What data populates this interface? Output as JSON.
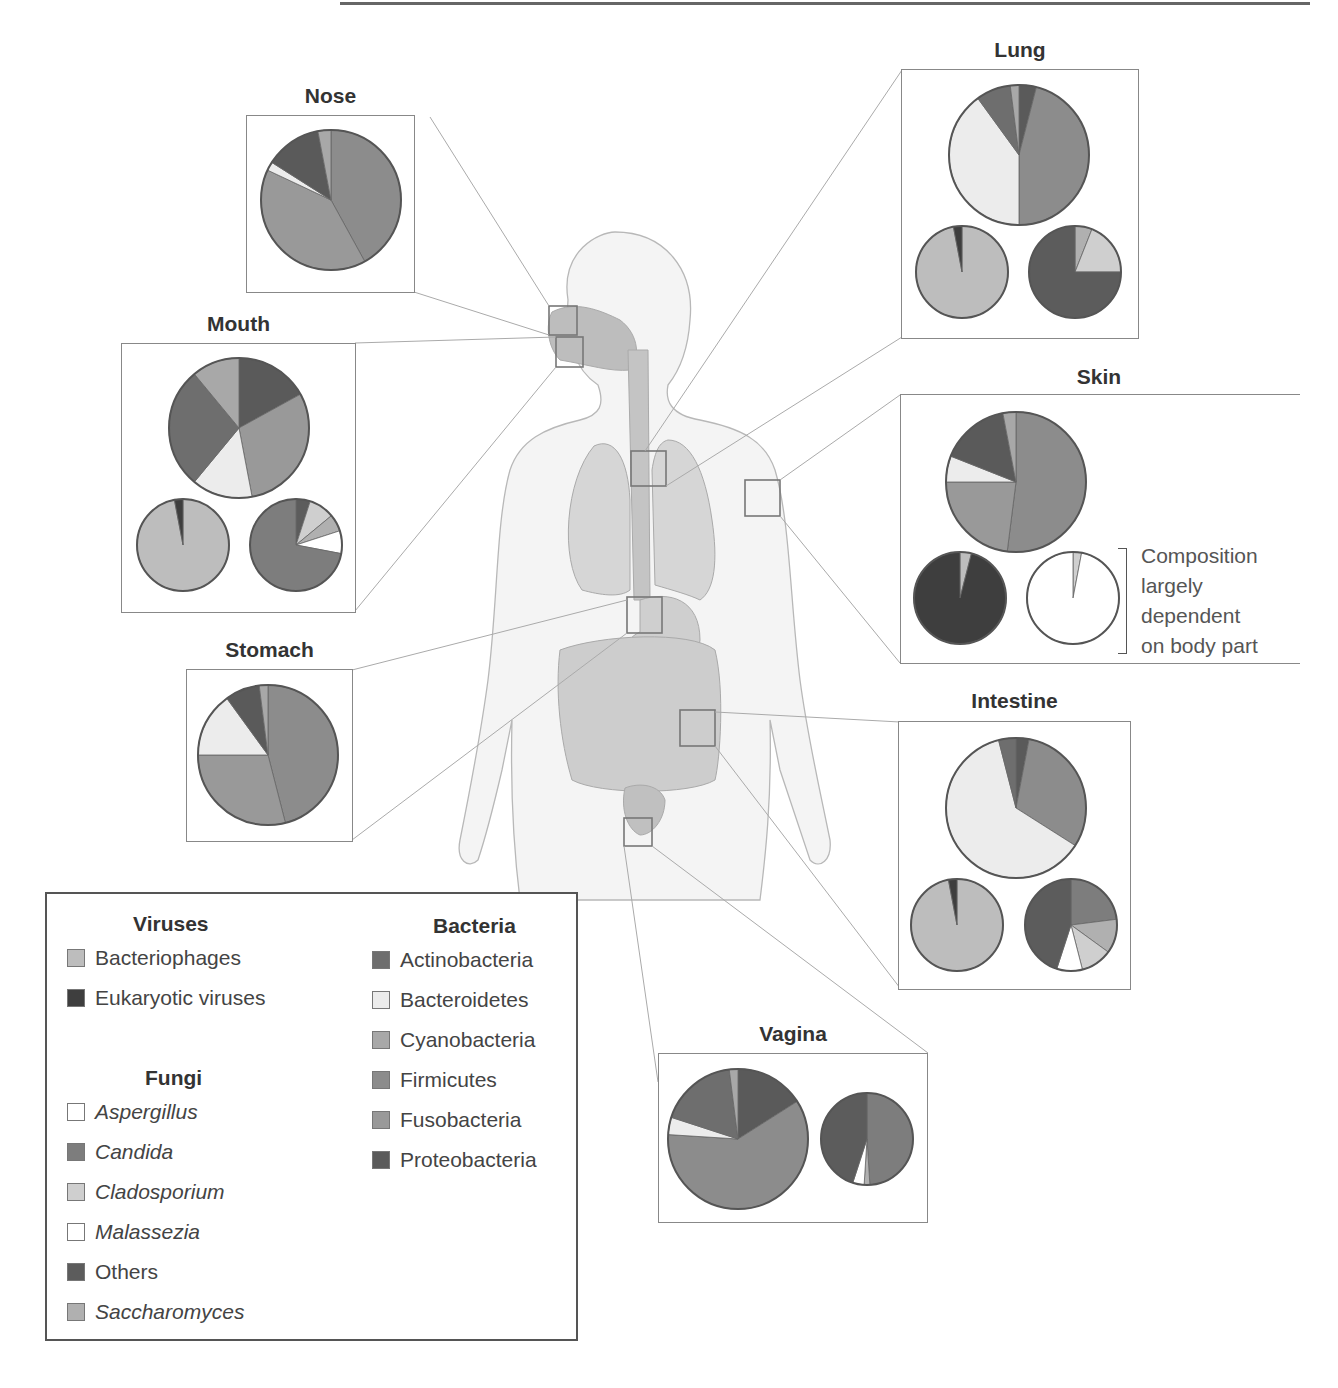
{
  "colors": {
    "Bacteriophages": "#bdbdbd",
    "Eukaryotic viruses": "#3e3e3e",
    "Aspergillus": "#ffffff",
    "Candida": "#7d7d7d",
    "Cladosporium": "#cfcfcf",
    "Malassezia": "#ffffff",
    "Others": "#5c5c5c",
    "Saccharomyces": "#b0b0b0",
    "Actinobacteria": "#6e6e6e",
    "Bacteroidetes": "#ececec",
    "Cyanobacteria": "#a8a8a8",
    "Firmicutes": "#8c8c8c",
    "Fusobacteria": "#999999",
    "Proteobacteria": "#5a5a5a"
  },
  "legend": {
    "viruses": {
      "title": "Viruses",
      "items": [
        "Bacteriophages",
        "Eukaryotic viruses"
      ]
    },
    "fungi": {
      "title": "Fungi",
      "items": [
        "Aspergillus",
        "Candida",
        "Cladosporium",
        "Malassezia",
        "Others",
        "Saccharomyces"
      ]
    },
    "bacteria": {
      "title": "Bacteria",
      "items": [
        "Actinobacteria",
        "Bacteroidetes",
        "Cyanobacteria",
        "Firmicutes",
        "Fusobacteria",
        "Proteobacteria"
      ]
    }
  },
  "skin_note": [
    "Composition",
    "largely",
    "dependent",
    "on body part"
  ],
  "chart_data": {
    "type": "pie",
    "sites": [
      {
        "name": "Nose",
        "charts": [
          {
            "kingdom": "Bacteria",
            "slices": [
              {
                "label": "Firmicutes",
                "value": 42
              },
              {
                "label": "Fusobacteria",
                "value": 40
              },
              {
                "label": "Bacteroidetes",
                "value": 2
              },
              {
                "label": "Proteobacteria",
                "value": 13
              },
              {
                "label": "Cyanobacteria",
                "value": 3
              }
            ]
          }
        ]
      },
      {
        "name": "Mouth",
        "charts": [
          {
            "kingdom": "Bacteria",
            "slices": [
              {
                "label": "Proteobacteria",
                "value": 17
              },
              {
                "label": "Fusobacteria",
                "value": 30
              },
              {
                "label": "Bacteroidetes",
                "value": 14
              },
              {
                "label": "Actinobacteria",
                "value": 28
              },
              {
                "label": "Cyanobacteria",
                "value": 11
              }
            ]
          },
          {
            "kingdom": "Viruses",
            "slices": [
              {
                "label": "Bacteriophages",
                "value": 97
              },
              {
                "label": "Eukaryotic viruses",
                "value": 3
              }
            ]
          },
          {
            "kingdom": "Fungi",
            "slices": [
              {
                "label": "Others",
                "value": 5
              },
              {
                "label": "Cladosporium",
                "value": 9
              },
              {
                "label": "Saccharomyces",
                "value": 6
              },
              {
                "label": "Aspergillus",
                "value": 8
              },
              {
                "label": "Candida",
                "value": 72
              }
            ]
          }
        ]
      },
      {
        "name": "Stomach",
        "charts": [
          {
            "kingdom": "Bacteria",
            "slices": [
              {
                "label": "Firmicutes",
                "value": 46
              },
              {
                "label": "Fusobacteria",
                "value": 29
              },
              {
                "label": "Bacteroidetes",
                "value": 15
              },
              {
                "label": "Proteobacteria",
                "value": 8
              },
              {
                "label": "Cyanobacteria",
                "value": 2
              }
            ]
          }
        ]
      },
      {
        "name": "Lung",
        "charts": [
          {
            "kingdom": "Bacteria",
            "slices": [
              {
                "label": "Proteobacteria",
                "value": 4
              },
              {
                "label": "Firmicutes",
                "value": 46
              },
              {
                "label": "Bacteroidetes",
                "value": 40
              },
              {
                "label": "Actinobacteria",
                "value": 8
              },
              {
                "label": "Cyanobacteria",
                "value": 2
              }
            ]
          },
          {
            "kingdom": "Viruses",
            "slices": [
              {
                "label": "Bacteriophages",
                "value": 97
              },
              {
                "label": "Eukaryotic viruses",
                "value": 3
              }
            ]
          },
          {
            "kingdom": "Fungi",
            "slices": [
              {
                "label": "Saccharomyces",
                "value": 6
              },
              {
                "label": "Cladosporium",
                "value": 19
              },
              {
                "label": "Others",
                "value": 75
              }
            ]
          }
        ]
      },
      {
        "name": "Skin",
        "charts": [
          {
            "kingdom": "Bacteria",
            "slices": [
              {
                "label": "Firmicutes",
                "value": 52
              },
              {
                "label": "Fusobacteria",
                "value": 23
              },
              {
                "label": "Bacteroidetes",
                "value": 6
              },
              {
                "label": "Proteobacteria",
                "value": 16
              },
              {
                "label": "Cyanobacteria",
                "value": 3
              }
            ]
          },
          {
            "kingdom": "Viruses",
            "slices": [
              {
                "label": "Bacteriophages",
                "value": 4
              },
              {
                "label": "Eukaryotic viruses",
                "value": 96
              }
            ]
          },
          {
            "kingdom": "Fungi",
            "slices": [
              {
                "label": "Cladosporium",
                "value": 3
              },
              {
                "label": "Malassezia",
                "value": 97
              }
            ]
          }
        ]
      },
      {
        "name": "Intestine",
        "charts": [
          {
            "kingdom": "Bacteria",
            "slices": [
              {
                "label": "Proteobacteria",
                "value": 3
              },
              {
                "label": "Firmicutes",
                "value": 31
              },
              {
                "label": "Bacteroidetes",
                "value": 62
              },
              {
                "label": "Actinobacteria",
                "value": 4
              }
            ]
          },
          {
            "kingdom": "Viruses",
            "slices": [
              {
                "label": "Bacteriophages",
                "value": 97
              },
              {
                "label": "Eukaryotic viruses",
                "value": 3
              }
            ]
          },
          {
            "kingdom": "Fungi",
            "slices": [
              {
                "label": "Candida",
                "value": 23
              },
              {
                "label": "Saccharomyces",
                "value": 12
              },
              {
                "label": "Cladosporium",
                "value": 11
              },
              {
                "label": "Aspergillus",
                "value": 9
              },
              {
                "label": "Others",
                "value": 45
              }
            ]
          }
        ]
      },
      {
        "name": "Vagina",
        "charts": [
          {
            "kingdom": "Bacteria",
            "slices": [
              {
                "label": "Proteobacteria",
                "value": 16
              },
              {
                "label": "Firmicutes",
                "value": 60
              },
              {
                "label": "Bacteroidetes",
                "value": 4
              },
              {
                "label": "Actinobacteria",
                "value": 18
              },
              {
                "label": "Cyanobacteria",
                "value": 2
              }
            ]
          },
          {
            "kingdom": "Fungi",
            "slices": [
              {
                "label": "Candida",
                "value": 49
              },
              {
                "label": "Saccharomyces",
                "value": 2
              },
              {
                "label": "Aspergillus",
                "value": 4
              },
              {
                "label": "Others",
                "value": 45
              }
            ]
          }
        ]
      }
    ]
  }
}
